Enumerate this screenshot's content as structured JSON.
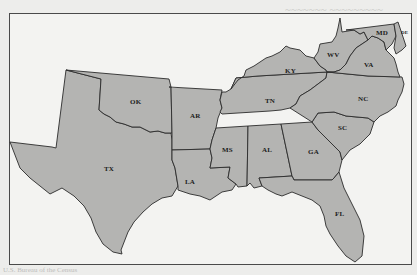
{
  "map": {
    "type": "choropleth-outline",
    "region": "Southern United States",
    "fill_color": "#b4b4b2",
    "border_color": "#2b2b2b",
    "states": [
      {
        "abbr": "TX",
        "x": 104,
        "y": 172
      },
      {
        "abbr": "OK",
        "x": 130,
        "y": 101
      },
      {
        "abbr": "AR",
        "x": 190,
        "y": 112
      },
      {
        "abbr": "LA",
        "x": 188,
        "y": 178
      },
      {
        "abbr": "MS",
        "x": 224,
        "y": 149
      },
      {
        "abbr": "AL",
        "x": 266,
        "y": 149
      },
      {
        "abbr": "GA",
        "x": 310,
        "y": 149
      },
      {
        "abbr": "FL",
        "x": 337,
        "y": 212
      },
      {
        "abbr": "SC",
        "x": 342,
        "y": 126
      },
      {
        "abbr": "NC",
        "x": 361,
        "y": 96
      },
      {
        "abbr": "TN",
        "x": 267,
        "y": 99
      },
      {
        "abbr": "KY",
        "x": 287,
        "y": 69
      },
      {
        "abbr": "WV",
        "x": 330,
        "y": 53
      },
      {
        "abbr": "VA",
        "x": 367,
        "y": 63
      },
      {
        "abbr": "MD",
        "x": 378,
        "y": 32
      },
      {
        "abbr": "DE",
        "x": 402,
        "y": 32
      }
    ]
  },
  "caption": "U.S. Bureau of the Census"
}
